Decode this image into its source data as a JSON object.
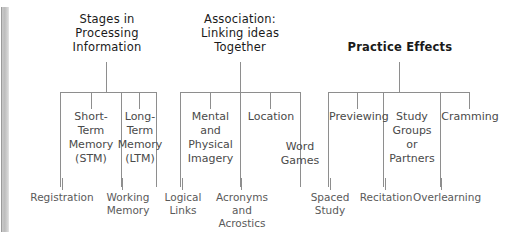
{
  "diagram": {
    "title_bar": "study-strategies-concept-map",
    "branches": [
      {
        "heading": "Stages in\nProcessing\nInformation",
        "bold": false,
        "nodes": [
          {
            "label": "Short-\nTerm\nMemory\n(STM)"
          },
          {
            "label": "Long-\nTerm\nMemory\n(LTM)"
          }
        ],
        "leaves": [
          {
            "label": "Registration"
          },
          {
            "label": "Working\nMemory"
          }
        ]
      },
      {
        "heading": "Association:\nLinking ideas\nTogether",
        "bold": false,
        "nodes": [
          {
            "label": "Mental\nand\nPhysical\nImagery"
          },
          {
            "label": "Location"
          },
          {
            "label": "Word\nGames"
          }
        ],
        "leaves": [
          {
            "label": "Logical\nLinks"
          },
          {
            "label": "Acronyms\nand\nAcrostics"
          }
        ]
      },
      {
        "heading": "Practice Effects",
        "bold": true,
        "nodes": [
          {
            "label": "Previewing"
          },
          {
            "label": "Study\nGroups\nor\nPartners"
          },
          {
            "label": "Cramming"
          }
        ],
        "leaves": [
          {
            "label": "Spaced\nStudy"
          },
          {
            "label": "Recitation"
          },
          {
            "label": "Overlearning"
          }
        ]
      }
    ]
  }
}
